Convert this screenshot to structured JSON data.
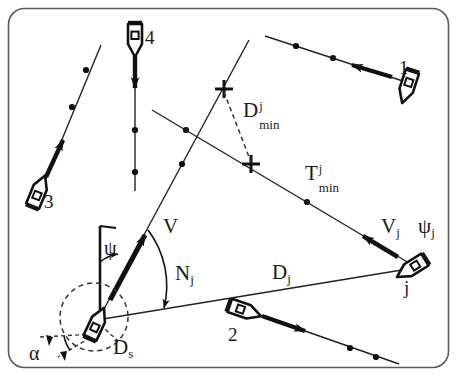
{
  "figure": {
    "type": "diagram",
    "border_color": "#555555",
    "line_color": "#1a1a1a",
    "background": "#ffffff"
  },
  "labels": {
    "ship1": "1",
    "ship2": "2",
    "ship3": "3",
    "ship4": "4",
    "shipj": "j",
    "own_speed": "V",
    "own_heading": "ψ",
    "relative_bearing": "N",
    "relative_bearing_sub": "j",
    "distance": "D",
    "distance_sub": "j",
    "safety_domain": "D",
    "safety_domain_sub": "s",
    "alpha": "α",
    "target_speed": "V",
    "target_speed_sub": "j",
    "target_heading": "ψ",
    "target_heading_sub": "j",
    "dmin_base": "D",
    "dmin_sup": "j",
    "dmin_sub": "min",
    "tmin_base": "T",
    "tmin_sup": "j",
    "tmin_sub": "min"
  },
  "geometry": {
    "frame": {
      "x": 8,
      "y": 8,
      "width": 441,
      "height": 360,
      "radius": 16
    },
    "own_ship": {
      "x": 95,
      "y": 320,
      "heading_deg": 22
    },
    "safety_circle": {
      "cx": 95,
      "cy": 318,
      "r": 35
    },
    "ship_j": {
      "x": 412,
      "y": 264,
      "heading_deg": 235
    },
    "tracks": [
      {
        "name": "ship1-track",
        "points": "265,37 411,84"
      },
      {
        "name": "ship2-track",
        "points": "232,306 398,364"
      },
      {
        "name": "ship3-track",
        "points": "100,44 43,182"
      },
      {
        "name": "ship4-track",
        "points": "136,47 136,190"
      },
      {
        "name": "shipj-track",
        "points": "153,111 412,265"
      },
      {
        "name": "own-track",
        "points": "96,320 248,41"
      }
    ],
    "cross_markers": [
      {
        "name": "dmin-upper-cross",
        "x": 224,
        "y": 89
      },
      {
        "name": "dmin-lower-cross",
        "x": 251,
        "y": 164
      }
    ]
  }
}
